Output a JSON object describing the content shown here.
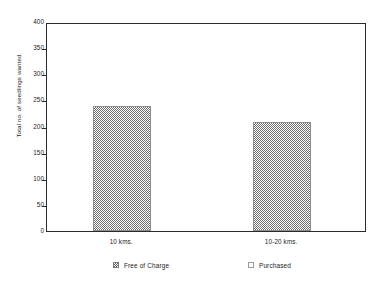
{
  "chart_data": {
    "type": "bar",
    "title": "",
    "subtitle": "",
    "xlabel": "",
    "ylabel": "Total no. of seedlings wanted",
    "categories": [
      "10 kms.",
      "10-20 kms."
    ],
    "ylim": [
      0,
      400
    ],
    "yticks": [
      0,
      50,
      100,
      150,
      200,
      250,
      300,
      350,
      400
    ],
    "ytick_labels": [
      "0",
      "50",
      "100",
      "150",
      "200",
      "250",
      "300",
      "350",
      "400"
    ],
    "grid": false,
    "legend_position": "bottom",
    "series": [
      {
        "name": "Free of Charge",
        "swatch": "dither",
        "values": [
          240,
          208
        ]
      },
      {
        "name": "Purchased",
        "swatch": "empty",
        "values": [
          0,
          0
        ]
      }
    ],
    "annotations": []
  },
  "legend": {
    "items": [
      {
        "label": "Free of Charge",
        "swatch": "dither"
      },
      {
        "label": "Purchased",
        "swatch": "empty"
      }
    ]
  },
  "colors": {
    "frame": "#2a2a2a",
    "text": "#1b1b1b",
    "bar_pattern": "#6f6f6f",
    "bar_border": "#8d8d8d",
    "background": "#ffffff"
  }
}
